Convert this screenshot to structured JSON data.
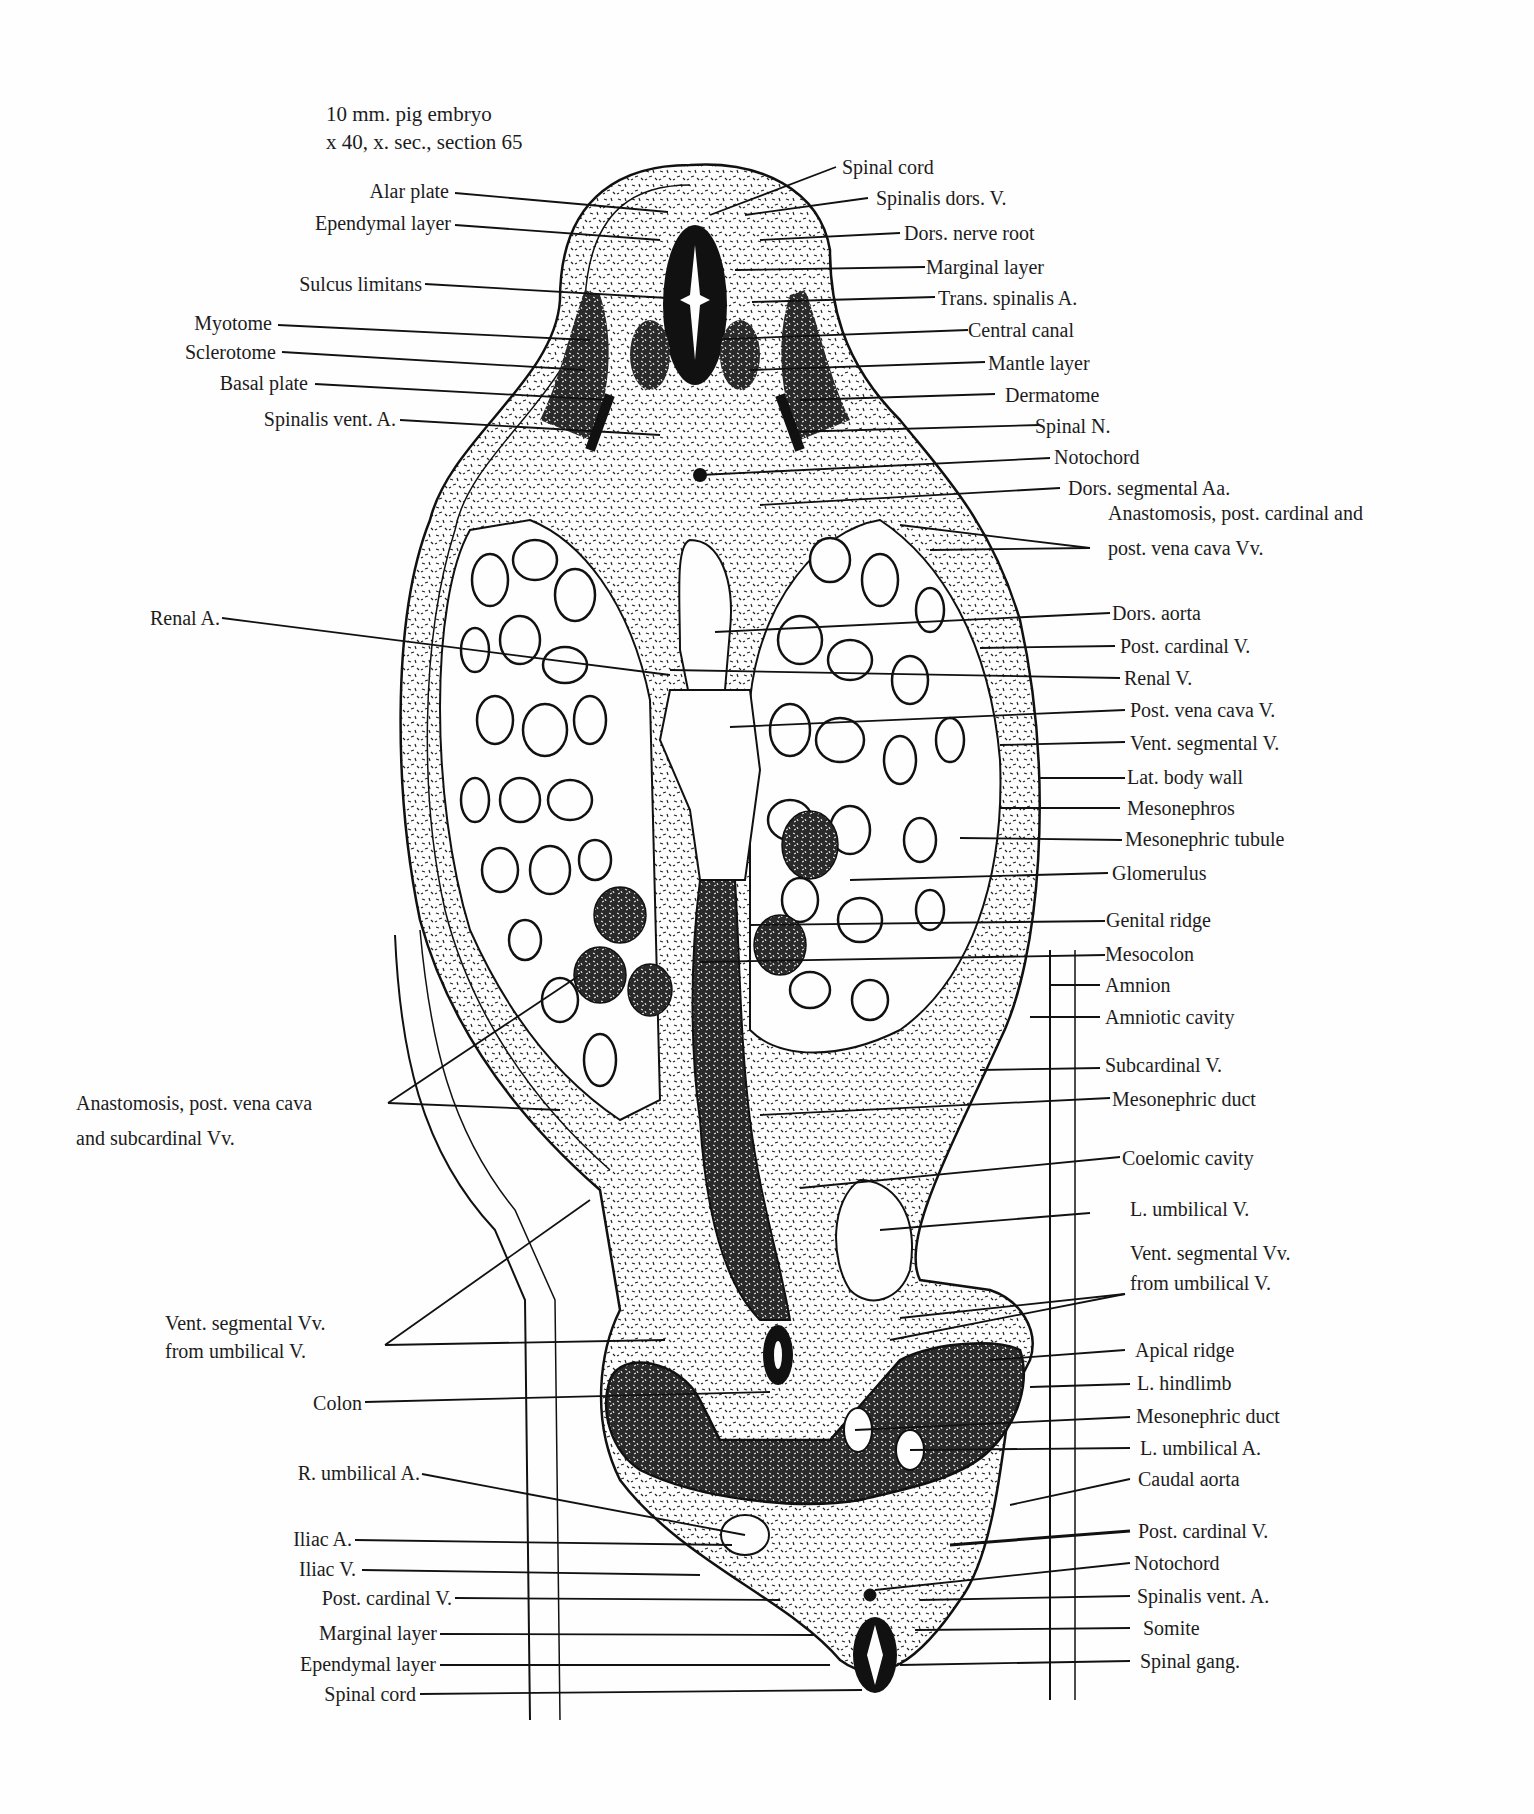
{
  "figure": {
    "title_line1": "10 mm. pig embryo",
    "title_line2": "x 40, x. sec., section 65",
    "colors": {
      "ink": "#111111",
      "paper": "#fefefe",
      "text": "#1c1c1c"
    }
  },
  "labels_left": [
    {
      "id": "alar-plate",
      "text": "Alar plate"
    },
    {
      "id": "ependymal-layer-top",
      "text": "Ependymal layer"
    },
    {
      "id": "sulcus-limitans",
      "text": "Sulcus limitans"
    },
    {
      "id": "myotome",
      "text": "Myotome"
    },
    {
      "id": "sclerotome",
      "text": "Sclerotome"
    },
    {
      "id": "basal-plate",
      "text": "Basal plate"
    },
    {
      "id": "spinalis-vent-a-top",
      "text": "Spinalis vent. A."
    },
    {
      "id": "renal-a",
      "text": "Renal A."
    },
    {
      "id": "anastomosis-pvc-subcardinal-1",
      "text": "Anastomosis, post. vena cava"
    },
    {
      "id": "anastomosis-pvc-subcardinal-2",
      "text": "and subcardinal Vv."
    },
    {
      "id": "vent-segmental-vv-left-1",
      "text": "Vent. segmental Vv."
    },
    {
      "id": "vent-segmental-vv-left-2",
      "text": "from umbilical V."
    },
    {
      "id": "colon",
      "text": "Colon"
    },
    {
      "id": "r-umbilical-a",
      "text": "R. umbilical A."
    },
    {
      "id": "iliac-a",
      "text": "Iliac A."
    },
    {
      "id": "iliac-v",
      "text": "Iliac V."
    },
    {
      "id": "post-cardinal-v-left",
      "text": "Post. cardinal V."
    },
    {
      "id": "marginal-layer-bottom",
      "text": "Marginal layer"
    },
    {
      "id": "ependymal-layer-bottom",
      "text": "Ependymal layer"
    },
    {
      "id": "spinal-cord-bottom",
      "text": "Spinal cord"
    }
  ],
  "labels_right": [
    {
      "id": "spinal-cord-top",
      "text": "Spinal cord"
    },
    {
      "id": "spinalis-dors-v",
      "text": "Spinalis dors. V."
    },
    {
      "id": "dors-nerve-root",
      "text": "Dors. nerve root"
    },
    {
      "id": "marginal-layer-top",
      "text": "Marginal layer"
    },
    {
      "id": "trans-spinalis-a",
      "text": "Trans. spinalis A."
    },
    {
      "id": "central-canal",
      "text": "Central canal"
    },
    {
      "id": "mantle-layer",
      "text": "Mantle layer"
    },
    {
      "id": "dermatome",
      "text": "Dermatome"
    },
    {
      "id": "spinal-n",
      "text": "Spinal N."
    },
    {
      "id": "notochord-top",
      "text": "Notochord"
    },
    {
      "id": "dors-segmental-aa",
      "text": "Dors. segmental Aa."
    },
    {
      "id": "anastomosis-pc-pvc-1",
      "text": "Anastomosis, post. cardinal and"
    },
    {
      "id": "anastomosis-pc-pvc-2",
      "text": "post. vena cava Vv."
    },
    {
      "id": "dors-aorta",
      "text": "Dors. aorta"
    },
    {
      "id": "post-cardinal-v-top",
      "text": "Post. cardinal V."
    },
    {
      "id": "renal-v",
      "text": "Renal V."
    },
    {
      "id": "post-vena-cava-v",
      "text": "Post. vena cava V."
    },
    {
      "id": "vent-segmental-v",
      "text": "Vent. segmental V."
    },
    {
      "id": "lat-body-wall",
      "text": "Lat. body wall"
    },
    {
      "id": "mesonephros",
      "text": "Mesonephros"
    },
    {
      "id": "mesonephric-tubule",
      "text": "Mesonephric tubule"
    },
    {
      "id": "glomerulus",
      "text": "Glomerulus"
    },
    {
      "id": "genital-ridge",
      "text": "Genital ridge"
    },
    {
      "id": "mesocolon",
      "text": "Mesocolon"
    },
    {
      "id": "amnion",
      "text": "Amnion"
    },
    {
      "id": "amniotic-cavity",
      "text": "Amniotic cavity"
    },
    {
      "id": "subcardinal-v",
      "text": "Subcardinal V."
    },
    {
      "id": "mesonephric-duct-top",
      "text": "Mesonephric duct"
    },
    {
      "id": "coelomic-cavity",
      "text": "Coelomic cavity"
    },
    {
      "id": "l-umbilical-v",
      "text": "L. umbilical V."
    },
    {
      "id": "vent-segmental-vv-right-1",
      "text": "Vent. segmental Vv."
    },
    {
      "id": "vent-segmental-vv-right-2",
      "text": "from umbilical V."
    },
    {
      "id": "apical-ridge",
      "text": "Apical ridge"
    },
    {
      "id": "l-hindlimb",
      "text": "L. hindlimb"
    },
    {
      "id": "mesonephric-duct-bottom",
      "text": "Mesonephric duct"
    },
    {
      "id": "l-umbilical-a",
      "text": "L. umbilical A."
    },
    {
      "id": "caudal-aorta",
      "text": "Caudal  aorta"
    },
    {
      "id": "post-cardinal-v-bottom",
      "text": "Post. cardinal V."
    },
    {
      "id": "notochord-bottom",
      "text": "Notochord"
    },
    {
      "id": "spinalis-vent-a-bottom",
      "text": "Spinalis vent. A."
    },
    {
      "id": "somite",
      "text": "Somite"
    },
    {
      "id": "spinal-gang",
      "text": "Spinal gang."
    }
  ]
}
